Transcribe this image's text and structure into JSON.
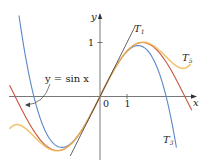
{
  "chart_data": {
    "type": "line",
    "title": "",
    "xlabel": "x",
    "ylabel": "y",
    "x_ticks": [
      {
        "value": 0,
        "label": "0"
      },
      {
        "value": 1,
        "label": "1"
      }
    ],
    "y_ticks": [
      {
        "value": 1,
        "label": "1"
      }
    ],
    "xlim": [
      -3.4,
      3.6
    ],
    "ylim": [
      -1.25,
      1.75
    ],
    "grid": false,
    "legend": "inline labels",
    "series": [
      {
        "name": "y = sin x",
        "function": "sin(x)",
        "color": "#c8553d",
        "domain": [
          -3.35,
          3.4
        ]
      },
      {
        "name": "T1",
        "function": "x",
        "color": "#3a3a3a",
        "domain": [
          -1.1,
          1.3
        ]
      },
      {
        "name": "T3",
        "function": "x - x^3/6",
        "color": "#5b86c9",
        "domain": [
          -3.0,
          2.83
        ]
      },
      {
        "name": "T5",
        "function": "x - x^3/6 + x^5/120",
        "color": "#f0b85a",
        "domain": [
          -3.35,
          3.35
        ]
      }
    ],
    "annotations": [
      {
        "text": "y = sin x",
        "points_to": "sin curve near x=-2.5"
      },
      {
        "text": "T1",
        "near": "upper end of tangent line"
      },
      {
        "text": "T3",
        "near": "lower right, blue curve"
      },
      {
        "text": "T5",
        "near": "upper right, orange curve"
      }
    ]
  },
  "labels": {
    "y_axis": "y",
    "x_axis": "x",
    "origin": "0",
    "x_tick_1": "1",
    "y_tick_1": "1",
    "sin_label": "y = sin x",
    "t1": "T",
    "t1_sub": "1",
    "t3": "T",
    "t3_sub": "3",
    "t5": "T",
    "t5_sub": "5"
  }
}
